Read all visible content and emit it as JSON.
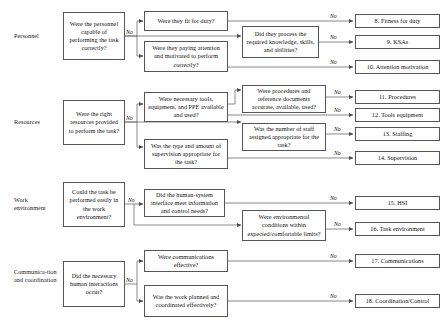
{
  "diagram": {
    "colors": {
      "box_border": "#555555",
      "line": "#6b6b6b",
      "text": "#111111",
      "background": "#ffffff"
    },
    "edge_label_default": "No",
    "row_labels": [
      {
        "id": "personnel",
        "text": "Personnel"
      },
      {
        "id": "resources",
        "text": "Resources"
      },
      {
        "id": "work-environment",
        "text": "Work environment"
      },
      {
        "id": "communication-coordination",
        "text": "Communica-tion and coordination"
      }
    ],
    "primary_questions": [
      {
        "id": "q-personnel",
        "text": "Were the personnel capable of performing the task correctly?"
      },
      {
        "id": "q-resources",
        "text": "Were the right resources provided to perform the task?"
      },
      {
        "id": "q-work-environment",
        "text": "Could the task be performed easily in the work environment?"
      },
      {
        "id": "q-communication",
        "text": "Did the necessary human interactions occur?"
      }
    ],
    "secondary_questions": [
      {
        "id": "q-fit-for-duty",
        "text": "Were they fit for duty?"
      },
      {
        "id": "q-paying-attention",
        "text": "Were they paying attention and motivated to perform correctly?"
      },
      {
        "id": "q-tools-ppe",
        "text": "Were necessary tools, equipment, and PPE available and used?"
      },
      {
        "id": "q-supervision",
        "text": "Was the type and amount of supervision appropriate for the task?"
      },
      {
        "id": "q-hsi",
        "text": "Did the human-system interface meet information and control needs?"
      },
      {
        "id": "q-communications-effective",
        "text": "Were communications effective?"
      },
      {
        "id": "q-work-planned",
        "text": "Was the work planned and coordinated effectively?"
      }
    ],
    "tertiary_questions": [
      {
        "id": "q-ksa",
        "text": "Did they process the required knowledge, skills, and abilities?"
      },
      {
        "id": "q-procedures",
        "text": "Were procedures and reference documents accurate, available, used?"
      },
      {
        "id": "q-staffing",
        "text": "Was the number of staff assigned appropriate for the task?"
      },
      {
        "id": "q-environmental",
        "text": "Were environmental conditions within expected/comfortable limits?"
      }
    ],
    "outcomes": [
      {
        "id": "outcome-8",
        "number": "8",
        "text": "8. Fitness for duty"
      },
      {
        "id": "outcome-9",
        "number": "9",
        "text": "9. KSAs"
      },
      {
        "id": "outcome-10",
        "number": "10",
        "text": "10. Attention motivation"
      },
      {
        "id": "outcome-11",
        "number": "11",
        "text": "11. Procedures"
      },
      {
        "id": "outcome-12",
        "number": "12",
        "text": "12. Tools equipment"
      },
      {
        "id": "outcome-13",
        "number": "13",
        "text": "13. Staffing"
      },
      {
        "id": "outcome-14",
        "number": "14",
        "text": "14. Supervision"
      },
      {
        "id": "outcome-15",
        "number": "15",
        "text": "15. HSI"
      },
      {
        "id": "outcome-16",
        "number": "16",
        "text": "16. Task environment"
      },
      {
        "id": "outcome-17",
        "number": "17",
        "text": "17. Communications"
      },
      {
        "id": "outcome-18",
        "number": "18",
        "text": "18. Coordination/Control"
      }
    ],
    "edge_labels": [
      {
        "id": "no-personnel",
        "text": "No"
      },
      {
        "id": "no-resources",
        "text": "No"
      },
      {
        "id": "no-work-environment",
        "text": "No"
      },
      {
        "id": "no-communication",
        "text": "No"
      },
      {
        "id": "no-8",
        "text": "No"
      },
      {
        "id": "no-9",
        "text": "No"
      },
      {
        "id": "no-10",
        "text": "No"
      },
      {
        "id": "no-11",
        "text": "No"
      },
      {
        "id": "no-12",
        "text": "No"
      },
      {
        "id": "no-13",
        "text": "No"
      },
      {
        "id": "no-14",
        "text": "No"
      },
      {
        "id": "no-15",
        "text": "No"
      },
      {
        "id": "no-16",
        "text": "No"
      },
      {
        "id": "no-17",
        "text": "No"
      },
      {
        "id": "no-18",
        "text": "No"
      }
    ]
  }
}
